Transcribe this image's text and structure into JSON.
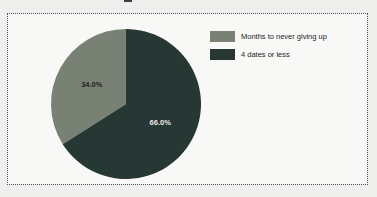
{
  "page": {
    "background": "#efefed"
  },
  "frame": {
    "background": "#f8f8f6",
    "border_color": "#4f4f4f",
    "border_style": "dotted"
  },
  "chart_data": {
    "type": "pie",
    "categories": [
      "Months to never giving up",
      "4 dates or less"
    ],
    "values": [
      34.0,
      66.0
    ],
    "slice_labels": [
      "34.0%",
      "66.0%"
    ],
    "colors": [
      "#798175",
      "#263734"
    ],
    "slice_label_colors": [
      "#1e1e1e",
      "#e8e8e8"
    ],
    "start_angle": "top",
    "direction": "counter-clockwise",
    "legend_position": "right",
    "legend_text_color": "#262626"
  }
}
